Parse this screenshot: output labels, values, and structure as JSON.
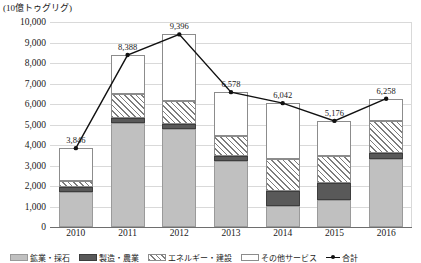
{
  "unit_label": "(10億トゥグリグ)",
  "chart_data": {
    "type": "bar",
    "title": "",
    "xlabel": "",
    "ylabel": "(10億トゥグリグ)",
    "ylim": [
      0,
      10000
    ],
    "yticks": [
      "0",
      "1,000",
      "2,000",
      "3,000",
      "4,000",
      "5,000",
      "6,000",
      "7,000",
      "8,000",
      "9,000",
      "10,000"
    ],
    "grid": true,
    "stacked": true,
    "legend_position": "bottom",
    "categories": [
      "2010",
      "2011",
      "2012",
      "2013",
      "2014",
      "2015",
      "2016"
    ],
    "series": [
      {
        "name": "鉱業・採石",
        "key": "mining",
        "values": [
          1730,
          5050,
          4780,
          3200,
          1020,
          1340,
          3320
        ]
      },
      {
        "name": "製造・農業",
        "key": "manufacturing",
        "values": [
          200,
          260,
          250,
          250,
          720,
          800,
          270
        ]
      },
      {
        "name": "エネルギー・建設",
        "key": "energy",
        "values": [
          300,
          1160,
          1120,
          1000,
          1560,
          1330,
          1560
        ]
      },
      {
        "name": "その他サービス",
        "key": "other_services",
        "values": [
          1616,
          1918,
          3246,
          2128,
          2742,
          1706,
          1108
        ]
      }
    ],
    "total_line": {
      "name": "合計",
      "values": [
        3846,
        8388,
        9396,
        6578,
        6042,
        5176,
        6258
      ],
      "labels": [
        "3,846",
        "8,388",
        "9,396",
        "6,578",
        "6,042",
        "5,176",
        "6,258"
      ]
    }
  },
  "legend": {
    "items": [
      {
        "label": "鉱業・採石",
        "swatch": "sw-mining"
      },
      {
        "label": "製造・農業",
        "swatch": "sw-manu"
      },
      {
        "label": "エネルギー・建設",
        "swatch": "sw-energy"
      },
      {
        "label": "その他サービス",
        "swatch": "sw-other"
      },
      {
        "label": "合計",
        "swatch": "sw-total"
      }
    ]
  }
}
